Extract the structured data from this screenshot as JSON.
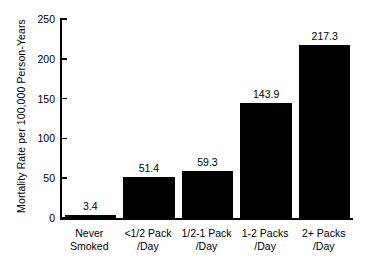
{
  "chart_data": {
    "type": "bar",
    "title": "",
    "xlabel": "",
    "ylabel": "Mortality Rate per 100,000 Person-Years",
    "categories": [
      "Never Smoked",
      "<1/2 Pack /Day",
      "1/2-1 Pack /Day",
      "1-2 Packs /Day",
      "2+ Packs /Day"
    ],
    "category_lines": [
      [
        "Never",
        "Smoked"
      ],
      [
        "<1/2 Pack",
        "/Day"
      ],
      [
        "1/2-1 Pack",
        "/Day"
      ],
      [
        "1-2 Packs",
        "/Day"
      ],
      [
        "2+ Packs",
        "/Day"
      ]
    ],
    "values": [
      3.4,
      51.4,
      59.3,
      143.9,
      217.3
    ],
    "value_labels": [
      "3.4",
      "51.4",
      "59.3",
      "143.9",
      "217.3"
    ],
    "ylim": [
      0,
      250
    ],
    "yticks": [
      0,
      50,
      100,
      150,
      200,
      250
    ],
    "ytick_labels": [
      "0",
      "50",
      "100",
      "150",
      "200",
      "250"
    ],
    "grid": false,
    "legend": "none",
    "bar_color": "#000000",
    "background_color": "#ffffff",
    "axis_color": "#000000"
  }
}
